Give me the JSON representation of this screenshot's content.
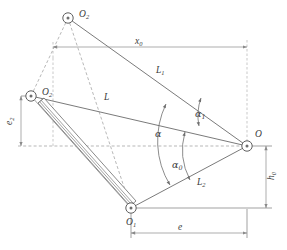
{
  "figure": {
    "type": "mechanism-kinematic-diagram",
    "background_color": "#ffffff",
    "line_color": "#6b6b6b",
    "dashed_color": "#9a9a9a",
    "text_color": "#3a3a3a"
  },
  "nodes": [
    {
      "id": "O2top",
      "label": "O",
      "sub": "2",
      "x": 68,
      "y": 18,
      "label_x": 79,
      "label_y": 17
    },
    {
      "id": "O2left",
      "label": "O",
      "sub": "2",
      "x": 31,
      "y": 96,
      "label_x": 42,
      "label_y": 95
    },
    {
      "id": "O1",
      "label": "O",
      "sub": "1",
      "x": 131,
      "y": 208,
      "label_x": 126,
      "label_y": 225
    },
    {
      "id": "O",
      "label": "O",
      "sub": "",
      "x": 247,
      "y": 146,
      "label_x": 255,
      "label_y": 137
    }
  ],
  "links": [
    {
      "id": "L1",
      "label": "L",
      "sub": "1",
      "label_x": 156,
      "label_y": 73,
      "from": "O2top",
      "to": "O"
    },
    {
      "id": "L",
      "label": "L",
      "sub": "",
      "label_x": 104,
      "label_y": 100,
      "from": "O2left",
      "to": "O"
    },
    {
      "id": "L2",
      "label": "L",
      "sub": "2",
      "label_x": 197,
      "label_y": 185,
      "from": "O1",
      "to": "O"
    }
  ],
  "angles": [
    {
      "id": "alpha1",
      "label": "α",
      "sub": "1",
      "label_x": 195,
      "label_y": 117
    },
    {
      "id": "alpha",
      "label": "α",
      "sub": "",
      "label_x": 155,
      "label_y": 137
    },
    {
      "id": "alpha0",
      "label": "α",
      "sub": "0",
      "label_x": 172,
      "label_y": 168
    }
  ],
  "dimensions": [
    {
      "id": "x0",
      "label": "x",
      "sub": "0",
      "label_x": 135,
      "label_y": 47,
      "orientation": "horizontal",
      "position": "top"
    },
    {
      "id": "e2",
      "label": "e",
      "sub": "2",
      "label_x": 12,
      "label_y": 125,
      "orientation": "vertical",
      "position": "left"
    },
    {
      "id": "h0",
      "label": "h",
      "sub": "0",
      "label_x": 272,
      "label_y": 178,
      "orientation": "vertical",
      "position": "right"
    },
    {
      "id": "e",
      "label": "e",
      "sub": "",
      "label_x": 178,
      "label_y": 233,
      "orientation": "horizontal",
      "position": "bottom"
    }
  ],
  "actuator": {
    "id": "hydraulic-cylinder",
    "from": "O2left",
    "to": "O1",
    "style": "double-line-cylinder"
  }
}
